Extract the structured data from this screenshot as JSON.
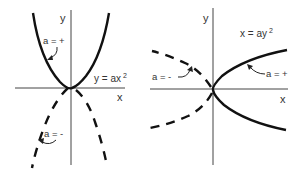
{
  "left_panel": {
    "x_axis_label": "x",
    "y_axis_label": "y",
    "equation": "y = ax",
    "equation_exponent": "2",
    "positive_label": "a = +",
    "negative_label": "a = -"
  },
  "right_panel": {
    "x_axis_label": "x",
    "y_axis_label": "y",
    "equation": "x = ay",
    "equation_exponent": "2",
    "positive_label": "a = +",
    "negative_label": "a = -"
  },
  "colors": {
    "curve": "#111111",
    "axis": "#444444",
    "text": "#333333"
  }
}
